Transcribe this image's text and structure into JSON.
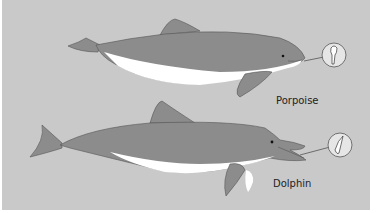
{
  "figure": {
    "background_color": "#c9c9c9",
    "body_color": "#8c8c8c",
    "belly_color": "#ffffff",
    "outline_color": "#444444"
  },
  "animals": [
    {
      "name": "porpoise",
      "label": "Porpoise",
      "detail": "spade-shaped tooth inset"
    },
    {
      "name": "dolphin",
      "label": "Dolphin",
      "detail": "conical tooth inset"
    }
  ]
}
